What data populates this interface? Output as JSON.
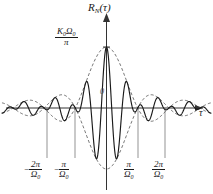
{
  "figure": {
    "axis_y_label": "R",
    "axis_y_label_sub": "N",
    "axis_y_label_arg": "(τ)",
    "axis_x_label": "τ",
    "origin_label": "0",
    "peak_numerator": "K₀Ω₀",
    "peak_denominator": "π",
    "peak_num_main": "K",
    "peak_num_sub1": "0",
    "peak_num_main2": "Ω",
    "peak_num_sub2": "0"
  },
  "ticks": [
    {
      "sign": "−",
      "num": "2π",
      "den_main": "Ω",
      "den_sub": "0",
      "value": -2,
      "x": 47
    },
    {
      "sign": "−",
      "num": "π",
      "den_main": "Ω",
      "den_sub": "0",
      "value": -1,
      "x": 75
    },
    {
      "sign": "",
      "num": "π",
      "den_main": "Ω",
      "den_sub": "0",
      "value": 1,
      "x": 138
    },
    {
      "sign": "",
      "num": "2π",
      "den_main": "Ω",
      "den_sub": "0",
      "value": 2,
      "x": 165
    }
  ],
  "colors": {
    "curve": "#1a1a1a",
    "envelope": "#4d4d4d",
    "axis": "#333333",
    "dropline": "#555555",
    "background": "#ffffff"
  },
  "chart_data": {
    "type": "line",
    "title": "",
    "xlabel": "τ",
    "ylabel": "R_N(τ)",
    "xlim": [
      -3.35,
      3.35
    ],
    "ylim": [
      -1.15,
      1.15
    ],
    "grid": false,
    "legend": null,
    "function": "R_N(tau) = (K0*Omega0/pi) * sinc(Omega0*tau/ (2)) * cos(omega0*tau)",
    "peak_value_label": "K₀Ω₀/π",
    "peak_value": 1.0,
    "peak_x": 0,
    "envelope": {
      "type": "sinc",
      "formula": "sin(pi*x)/(pi*x) with x in units of pi/Omega0",
      "zero_crossings_x": [
        -3,
        -2,
        -1,
        1,
        2,
        3
      ],
      "lobe_peaks_x": [
        0,
        -1.43,
        1.43,
        -2.46,
        2.46
      ],
      "lobe_peaks_y": [
        1.0,
        -0.217,
        -0.217,
        0.128,
        0.128
      ]
    },
    "carrier": {
      "cycles_per_unit": 3.0,
      "description": "cos(omega0 * tau) with omega0 >> Omega0"
    },
    "x_tick_values": [
      -2,
      -1,
      1,
      2
    ],
    "x_tick_labels": [
      "−2π/Ω₀",
      "−π/Ω₀",
      "π/Ω₀",
      "2π/Ω₀"
    ],
    "y_tick_values": [
      1.0
    ],
    "y_tick_labels": [
      "K₀Ω₀/π"
    ],
    "series": [
      {
        "name": "R_N(tau)",
        "style": "solid",
        "color": "#1a1a1a"
      },
      {
        "name": "envelope upper",
        "style": "dashed",
        "color": "#4d4d4d"
      },
      {
        "name": "envelope lower",
        "style": "dashed",
        "color": "#4d4d4d"
      }
    ]
  }
}
